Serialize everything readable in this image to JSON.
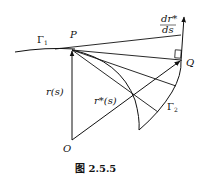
{
  "figure": {
    "caption": "图 2.5.5",
    "labels": {
      "gamma1": "Γ",
      "gamma1_sub": "1",
      "gamma2": "Γ",
      "gamma2_sub": "2",
      "P": "P",
      "Q": "Q",
      "O": "O",
      "r_s": "r(s)",
      "r_star_s": "r*(s)",
      "deriv_num": "dr*",
      "deriv_den": "ds"
    }
  }
}
